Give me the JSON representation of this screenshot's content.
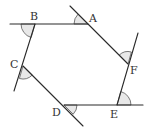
{
  "figure": {
    "colors": {
      "line": "#2a2a2a",
      "angle_fill": "#e8e8e8",
      "label": "#333333",
      "background": "#ffffff"
    },
    "vertices": [
      {
        "label": "A",
        "x": 88,
        "y": 24
      },
      {
        "label": "B",
        "x": 35,
        "y": 24
      },
      {
        "label": "C",
        "x": 23,
        "y": 66
      },
      {
        "label": "D",
        "x": 64,
        "y": 105
      },
      {
        "label": "E",
        "x": 117,
        "y": 105
      },
      {
        "label": "F",
        "x": 128,
        "y": 64
      }
    ],
    "labels": {
      "A": "A",
      "B": "B",
      "C": "C",
      "D": "D",
      "E": "E",
      "F": "F"
    },
    "exterior_angles_marked": [
      "A",
      "B",
      "C",
      "D",
      "E",
      "F"
    ]
  }
}
